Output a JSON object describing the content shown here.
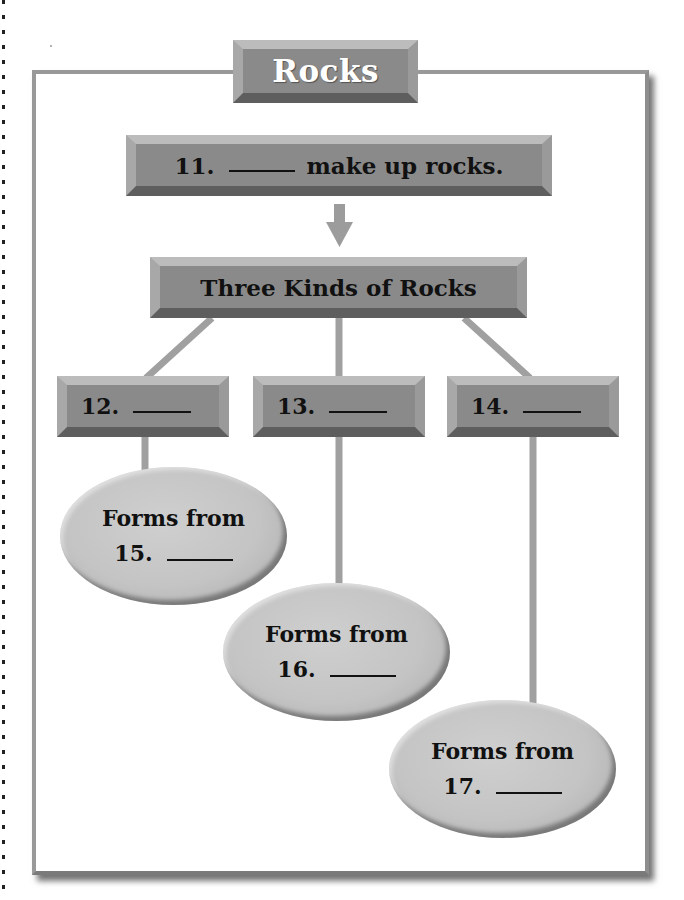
{
  "title": "Rocks",
  "colors": {
    "box_fill": "#8a8a8a",
    "box_bevel_light": "#bcbcbc",
    "box_bevel_dark": "#5e5e5e",
    "connector": "#a0a0a0",
    "oval_fill": "#c4c4c4",
    "frame_border": "#999999",
    "title_text": "#ffffff",
    "text": "#111111"
  },
  "top_box": {
    "number": "11.",
    "blank": "_____",
    "text": "make up rocks."
  },
  "category_box": {
    "text": "Three Kinds of Rocks"
  },
  "kinds": [
    {
      "number": "12.",
      "blank": "_____"
    },
    {
      "number": "13.",
      "blank": "_____"
    },
    {
      "number": "14.",
      "blank": "_____"
    }
  ],
  "origins": [
    {
      "label": "Forms from",
      "number": "15.",
      "blank": "_____"
    },
    {
      "label": "Forms from",
      "number": "16.",
      "blank": "_____"
    },
    {
      "label": "Forms from",
      "number": "17.",
      "blank": "_____"
    }
  ]
}
